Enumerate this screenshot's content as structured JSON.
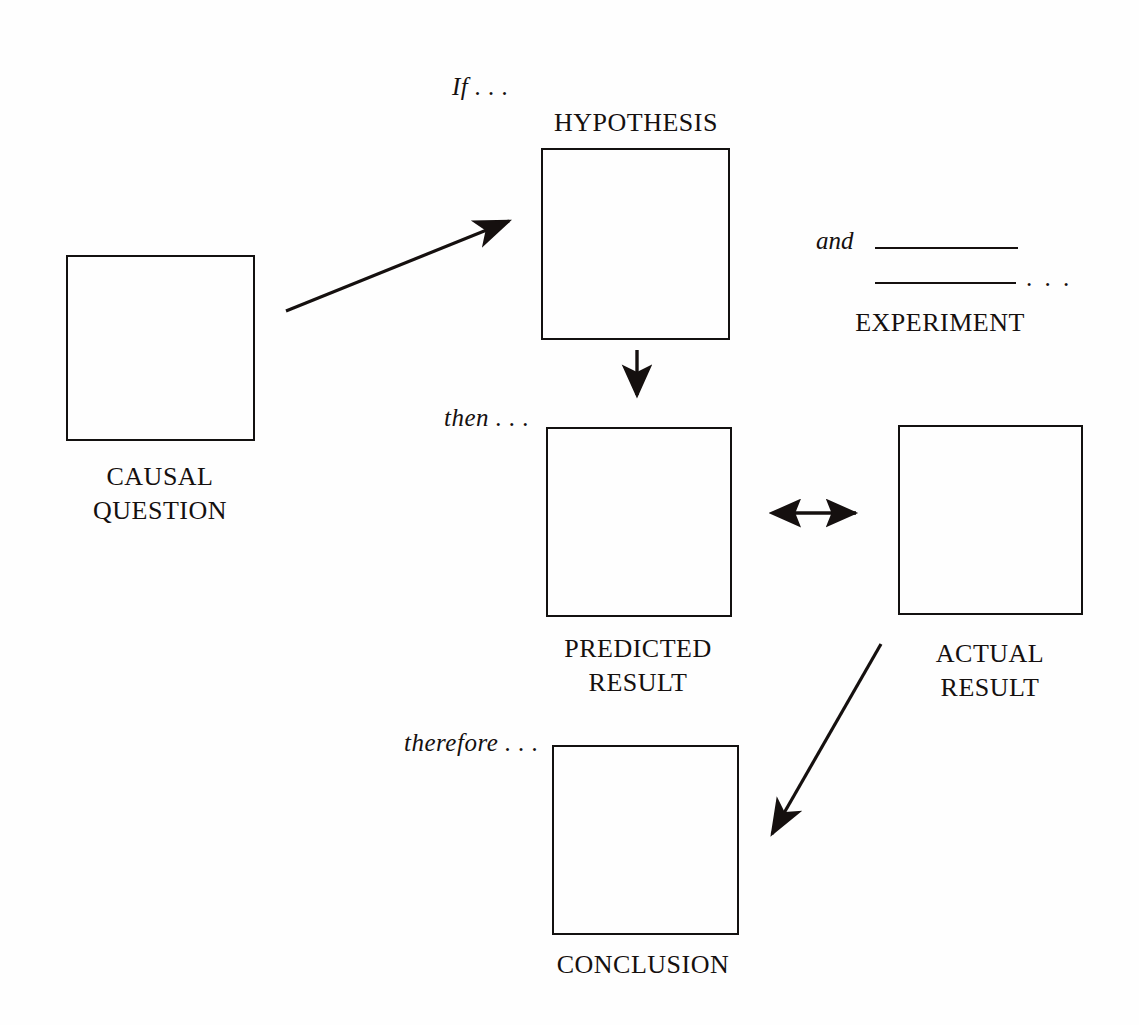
{
  "diagram": {
    "background_color": "#fefefe",
    "stroke_color": "#15100f",
    "nodes": [
      {
        "id": "causal-question",
        "caption": "CAUSAL\nQUESTION"
      },
      {
        "id": "hypothesis",
        "caption": "HYPOTHESIS"
      },
      {
        "id": "experiment",
        "caption": "EXPERIMENT"
      },
      {
        "id": "predicted-result",
        "caption": "PREDICTED\nRESULT"
      },
      {
        "id": "actual-result",
        "caption": "ACTUAL\nRESULT"
      },
      {
        "id": "conclusion",
        "caption": "CONCLUSION"
      }
    ],
    "connector_labels": {
      "if": "If . . .",
      "and": "and",
      "then": "then . . .",
      "therefore": "therefore . . .",
      "experiment_trailing_dots": ". . ."
    },
    "arrows": [
      {
        "id": "question-to-hypothesis",
        "from": "causal-question",
        "to": "hypothesis",
        "style": "single-headed-diagonal"
      },
      {
        "id": "hypothesis-to-predicted",
        "from": "hypothesis",
        "to": "predicted-result",
        "style": "single-headed-down"
      },
      {
        "id": "predicted-vs-actual",
        "from": "predicted-result",
        "to": "actual-result",
        "style": "double-headed-horizontal"
      },
      {
        "id": "actual-to-conclusion",
        "from": "actual-result",
        "to": "conclusion",
        "style": "single-headed-diagonal"
      }
    ]
  }
}
